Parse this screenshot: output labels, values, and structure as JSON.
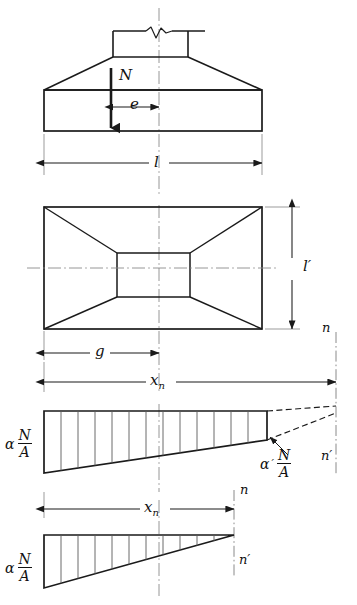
{
  "figure": {
    "ink_color": "#1a1a1a",
    "background": "#ffffff"
  },
  "views": {
    "elevation": {
      "name": "elevation-view",
      "load_label": "N",
      "eccentricity_label": "e",
      "width_dimension_label": "l",
      "break_symbol": "column-break-line"
    },
    "plan": {
      "name": "plan-view",
      "height_dimension_label": "l′",
      "pedestal_dimension_label": "g"
    },
    "pressure_upper": {
      "name": "pressure-diagram-trapezoid",
      "span_dimension_label": "x",
      "span_dimension_sub": "n",
      "left_ordinate_coef": "α",
      "left_ordinate_num": "N",
      "left_ordinate_den": "A",
      "right_ordinate_coef": "α",
      "right_ordinate_prime": "′",
      "right_ordinate_num": "N",
      "right_ordinate_den": "A",
      "section_top_label": "n",
      "section_bottom_label": "n′"
    },
    "pressure_lower": {
      "name": "pressure-diagram-triangle",
      "span_dimension_label": "x",
      "span_dimension_sub": "n",
      "left_ordinate_coef": "α",
      "left_ordinate_num": "N",
      "left_ordinate_den": "A",
      "section_top_label": "n",
      "section_bottom_label": "n′"
    }
  },
  "symbols": {
    "alpha": "α",
    "prime": "′",
    "N": "N",
    "A": "A",
    "x": "x",
    "n": "n",
    "e": "e",
    "g": "g",
    "l": "l"
  }
}
